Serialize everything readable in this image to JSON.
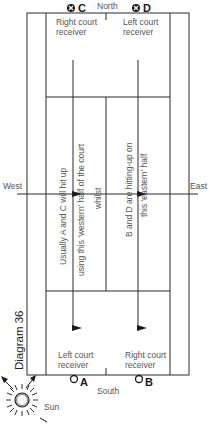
{
  "diagram": {
    "title": "Diagram 36",
    "compass": {
      "north": "North",
      "south": "South",
      "west": "West",
      "east": "East"
    },
    "players": {
      "C": {
        "label": "C",
        "marker": "crossed-circle",
        "position": "north-left"
      },
      "D": {
        "label": "D",
        "marker": "crossed-circle",
        "position": "north-right"
      },
      "A": {
        "label": "A",
        "marker": "open-circle",
        "position": "south-left"
      },
      "B": {
        "label": "B",
        "marker": "open-circle",
        "position": "south-right"
      }
    },
    "receivers": {
      "north_left_line1": "Right court",
      "north_left_line2": "receiver",
      "north_right_line1": "Left court",
      "north_right_line2": "receiver",
      "south_left_line1": "Left court",
      "south_left_line2": "receiver",
      "south_right_line1": "Right court",
      "south_right_line2": "receiver"
    },
    "annotations": {
      "west_line1": "Usually A and C will hit up",
      "west_line2": "using this 'western' half of the court",
      "middle": "whilst",
      "east_line1": "B and D are hitting-up on",
      "east_line2": "this 'eastern' half"
    },
    "sun": {
      "label": "Sun"
    },
    "colors": {
      "line": "#2a2a2a",
      "text": "#555555",
      "background": "#ffffff"
    }
  }
}
